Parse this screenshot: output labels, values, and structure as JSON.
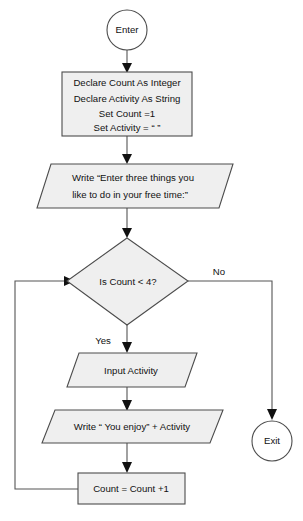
{
  "diagram": {
    "type": "flowchart",
    "background_color": "#ffffff",
    "shape_fill_color": "#efefef",
    "shape_stroke_color": "#4c4c4c",
    "connector_color": "#555555",
    "text_color": "#111111"
  },
  "nodes": {
    "start": {
      "shape": "circle",
      "label": "Enter"
    },
    "declare": {
      "shape": "process",
      "line1": "Declare Count As Integer",
      "line2": "Declare Activity As String",
      "line3": "Set Count =1",
      "line4": "Set Activity = “ ”"
    },
    "prompt": {
      "shape": "parallelogram",
      "line1": "Write “Enter three things you",
      "line2": "like to do in your free time:”"
    },
    "decision": {
      "shape": "diamond",
      "label": "Is Count < 4?"
    },
    "input": {
      "shape": "parallelogram",
      "label": "Input Activity"
    },
    "output": {
      "shape": "parallelogram",
      "label": "Write “ You enjoy” + Activity"
    },
    "increment": {
      "shape": "process",
      "label": "Count = Count +1"
    },
    "end": {
      "shape": "circle",
      "label": "Exit"
    }
  },
  "edge_labels": {
    "yes": "Yes",
    "no": "No"
  }
}
